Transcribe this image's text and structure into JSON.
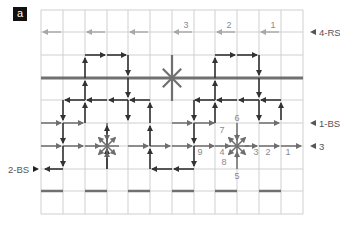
{
  "panel_label": "a",
  "colors": {
    "grid": "#cfcfcf",
    "thick": "#707070",
    "arrow_dark": "#333333",
    "arrow_mid": "#6e6e6e",
    "arrow_light": "#a8a8a8",
    "label": "#555555",
    "label_light": "#8a8a8a"
  },
  "grid": {
    "x0": 41,
    "y0": 10,
    "cols": 12,
    "rows": 9,
    "xs": [
      41,
      63,
      85,
      107,
      128,
      150,
      172,
      194,
      215,
      237,
      259,
      281,
      303
    ],
    "ys": [
      10,
      32,
      55,
      78,
      100,
      123,
      146,
      169,
      191,
      214
    ]
  },
  "side_labels": [
    {
      "id": "4-RS",
      "text": "4-RS",
      "x": 316,
      "y": 32,
      "marker": "left",
      "color": "label"
    },
    {
      "id": "1-BS",
      "text": "1-BS",
      "x": 316,
      "y": 123,
      "marker": "left",
      "color": "label"
    },
    {
      "id": "3",
      "text": "3",
      "x": 316,
      "y": 146,
      "marker": "left",
      "color": "label"
    },
    {
      "id": "2-BS",
      "text": "2-BS",
      "x": 8,
      "y": 169,
      "marker": "right",
      "color": "label"
    }
  ],
  "thick_lines": [
    {
      "x1": 41,
      "y1": 78,
      "x2": 303,
      "y2": 78
    }
  ],
  "dashes": [
    {
      "x1": 41,
      "x2": 63,
      "y": 191
    },
    {
      "x1": 85,
      "x2": 107,
      "y": 191
    },
    {
      "x1": 128,
      "x2": 150,
      "y": 191
    },
    {
      "x1": 172,
      "x2": 194,
      "y": 191
    },
    {
      "x1": 215,
      "x2": 237,
      "y": 191
    },
    {
      "x1": 259,
      "x2": 281,
      "y": 191
    }
  ],
  "row_4rs_arrows": [
    {
      "x1": 61,
      "y1": 32,
      "x2": 43,
      "y2": 32,
      "label": ""
    },
    {
      "x1": 105,
      "y1": 32,
      "x2": 87,
      "y2": 32,
      "label": ""
    },
    {
      "x1": 148,
      "y1": 32,
      "x2": 130,
      "y2": 32,
      "label": ""
    },
    {
      "x1": 192,
      "y1": 32,
      "x2": 174,
      "y2": 32,
      "label": "3"
    },
    {
      "x1": 235,
      "y1": 32,
      "x2": 217,
      "y2": 32,
      "label": "2"
    },
    {
      "x1": 279,
      "y1": 32,
      "x2": 261,
      "y2": 32,
      "label": "1"
    }
  ],
  "dark_arrows": [
    {
      "x1": 85,
      "y1": 55,
      "x2": 105,
      "y2": 55
    },
    {
      "x1": 107,
      "y1": 55,
      "x2": 126,
      "y2": 55
    },
    {
      "x1": 128,
      "y1": 55,
      "x2": 128,
      "y2": 75
    },
    {
      "x1": 85,
      "y1": 78,
      "x2": 85,
      "y2": 58
    },
    {
      "x1": 215,
      "y1": 55,
      "x2": 235,
      "y2": 55
    },
    {
      "x1": 237,
      "y1": 55,
      "x2": 257,
      "y2": 55
    },
    {
      "x1": 259,
      "y1": 55,
      "x2": 259,
      "y2": 75
    },
    {
      "x1": 215,
      "y1": 78,
      "x2": 215,
      "y2": 58
    },
    {
      "x1": 85,
      "y1": 100,
      "x2": 85,
      "y2": 81
    },
    {
      "x1": 128,
      "y1": 78,
      "x2": 128,
      "y2": 97
    },
    {
      "x1": 85,
      "y1": 100,
      "x2": 65,
      "y2": 100
    },
    {
      "x1": 107,
      "y1": 100,
      "x2": 87,
      "y2": 100
    },
    {
      "x1": 128,
      "y1": 100,
      "x2": 109,
      "y2": 100
    },
    {
      "x1": 150,
      "y1": 100,
      "x2": 130,
      "y2": 100
    },
    {
      "x1": 85,
      "y1": 123,
      "x2": 85,
      "y2": 103
    },
    {
      "x1": 128,
      "y1": 100,
      "x2": 128,
      "y2": 120
    },
    {
      "x1": 63,
      "y1": 100,
      "x2": 63,
      "y2": 120
    },
    {
      "x1": 150,
      "y1": 123,
      "x2": 150,
      "y2": 103
    },
    {
      "x1": 215,
      "y1": 100,
      "x2": 215,
      "y2": 81
    },
    {
      "x1": 259,
      "y1": 78,
      "x2": 259,
      "y2": 97
    },
    {
      "x1": 215,
      "y1": 100,
      "x2": 195,
      "y2": 100
    },
    {
      "x1": 237,
      "y1": 100,
      "x2": 217,
      "y2": 100
    },
    {
      "x1": 259,
      "y1": 100,
      "x2": 239,
      "y2": 100
    },
    {
      "x1": 281,
      "y1": 100,
      "x2": 261,
      "y2": 100
    },
    {
      "x1": 215,
      "y1": 123,
      "x2": 215,
      "y2": 103
    },
    {
      "x1": 259,
      "y1": 100,
      "x2": 259,
      "y2": 120
    },
    {
      "x1": 194,
      "y1": 100,
      "x2": 194,
      "y2": 120
    },
    {
      "x1": 281,
      "y1": 120,
      "x2": 281,
      "y2": 103
    },
    {
      "x1": 63,
      "y1": 123,
      "x2": 63,
      "y2": 143
    },
    {
      "x1": 63,
      "y1": 146,
      "x2": 63,
      "y2": 166
    },
    {
      "x1": 63,
      "y1": 169,
      "x2": 45,
      "y2": 169
    },
    {
      "x1": 107,
      "y1": 146,
      "x2": 107,
      "y2": 126
    },
    {
      "x1": 107,
      "y1": 169,
      "x2": 107,
      "y2": 149
    },
    {
      "x1": 194,
      "y1": 123,
      "x2": 194,
      "y2": 143
    },
    {
      "x1": 194,
      "y1": 146,
      "x2": 194,
      "y2": 166
    },
    {
      "x1": 194,
      "y1": 169,
      "x2": 174,
      "y2": 169
    },
    {
      "x1": 172,
      "y1": 169,
      "x2": 152,
      "y2": 169
    },
    {
      "x1": 150,
      "y1": 146,
      "x2": 150,
      "y2": 126
    },
    {
      "x1": 150,
      "y1": 169,
      "x2": 150,
      "y2": 149
    }
  ],
  "mid_arrows": [
    {
      "x1": 41,
      "y1": 123,
      "x2": 61,
      "y2": 123
    },
    {
      "x1": 63,
      "y1": 123,
      "x2": 83,
      "y2": 123
    },
    {
      "x1": 172,
      "y1": 123,
      "x2": 192,
      "y2": 123
    },
    {
      "x1": 194,
      "y1": 123,
      "x2": 214,
      "y2": 123
    },
    {
      "x1": 259,
      "y1": 123,
      "x2": 279,
      "y2": 123
    },
    {
      "x1": 41,
      "y1": 146,
      "x2": 61,
      "y2": 146
    },
    {
      "x1": 63,
      "y1": 146,
      "x2": 83,
      "y2": 146
    },
    {
      "x1": 85,
      "y1": 146,
      "x2": 100,
      "y2": 146
    },
    {
      "x1": 128,
      "y1": 146,
      "x2": 148,
      "y2": 146
    },
    {
      "x1": 150,
      "y1": 146,
      "x2": 170,
      "y2": 146
    },
    {
      "x1": 172,
      "y1": 146,
      "x2": 192,
      "y2": 146
    },
    {
      "x1": 194,
      "y1": 146,
      "x2": 214,
      "y2": 146
    },
    {
      "x1": 215,
      "y1": 146,
      "x2": 230,
      "y2": 146
    },
    {
      "x1": 245,
      "y1": 146,
      "x2": 257,
      "y2": 146
    },
    {
      "x1": 259,
      "y1": 146,
      "x2": 279,
      "y2": 146
    },
    {
      "x1": 281,
      "y1": 146,
      "x2": 301,
      "y2": 146
    },
    {
      "x1": 107,
      "y1": 169,
      "x2": 107,
      "y2": 152
    },
    {
      "x1": 237,
      "y1": 169,
      "x2": 237,
      "y2": 152
    },
    {
      "x1": 237,
      "y1": 123,
      "x2": 237,
      "y2": 140
    },
    {
      "x1": 107,
      "y1": 123,
      "x2": 107,
      "y2": 140
    }
  ],
  "stars": [
    {
      "cx": 172,
      "cy": 78,
      "r": 13,
      "type": "plain",
      "color": "thick"
    },
    {
      "cx": 107,
      "cy": 146,
      "r": 12,
      "type": "radial",
      "color": "arrow_mid"
    },
    {
      "cx": 237,
      "cy": 146,
      "r": 12,
      "type": "radial",
      "color": "arrow_mid"
    }
  ],
  "number_labels": [
    {
      "text": "6",
      "x": 237,
      "y": 121
    },
    {
      "text": "7",
      "x": 222,
      "y": 133
    },
    {
      "text": "4",
      "x": 222,
      "y": 155
    },
    {
      "text": "8",
      "x": 224,
      "y": 165
    },
    {
      "text": "3",
      "x": 256,
      "y": 155
    },
    {
      "text": "2",
      "x": 268,
      "y": 155
    },
    {
      "text": "1",
      "x": 288,
      "y": 155
    },
    {
      "text": "9",
      "x": 200,
      "y": 155
    },
    {
      "text": "5",
      "x": 237,
      "y": 179
    }
  ]
}
